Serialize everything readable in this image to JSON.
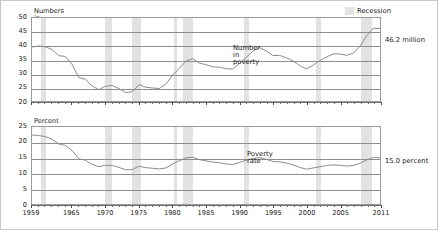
{
  "figure": {
    "legend": {
      "label": "Recession",
      "swatch_color": "#e2e2e2"
    },
    "background": "#ffffff",
    "line_color": "#8a8a8a",
    "grid_color": "#8d8d8d"
  },
  "chart_data": [
    {
      "type": "line",
      "title": "",
      "ylabel": "Numbers in millions",
      "xlabel": "",
      "ylim": [
        20,
        50
      ],
      "yticks": [
        20,
        25,
        30,
        35,
        40,
        45,
        50
      ],
      "xlim": [
        1959,
        2011
      ],
      "xticks": [
        1959,
        1965,
        1970,
        1975,
        1980,
        1985,
        1990,
        1995,
        2000,
        2005,
        2011
      ],
      "grid": true,
      "legend_position": "top-right",
      "series": [
        {
          "name": "Number in poverty",
          "annotation": "46.2 million",
          "x": [
            1959,
            1960,
            1961,
            1962,
            1963,
            1964,
            1965,
            1966,
            1967,
            1968,
            1969,
            1970,
            1971,
            1972,
            1973,
            1974,
            1975,
            1976,
            1977,
            1978,
            1979,
            1980,
            1981,
            1982,
            1983,
            1984,
            1985,
            1986,
            1987,
            1988,
            1989,
            1990,
            1991,
            1992,
            1993,
            1994,
            1995,
            1996,
            1997,
            1998,
            1999,
            2000,
            2001,
            2002,
            2003,
            2004,
            2005,
            2006,
            2007,
            2008,
            2009,
            2010,
            2011
          ],
          "values": [
            39.5,
            39.9,
            39.6,
            38.6,
            36.4,
            36.1,
            33.2,
            28.5,
            27.8,
            25.4,
            24.1,
            25.4,
            25.6,
            24.5,
            23.0,
            23.4,
            25.9,
            25.0,
            24.7,
            24.5,
            26.1,
            29.3,
            31.8,
            34.4,
            35.3,
            33.7,
            33.1,
            32.4,
            32.2,
            31.7,
            31.5,
            33.6,
            35.7,
            38.0,
            39.3,
            38.1,
            36.4,
            36.5,
            35.6,
            34.5,
            32.8,
            31.6,
            32.9,
            34.6,
            35.9,
            37.0,
            37.0,
            36.5,
            37.3,
            39.8,
            43.6,
            46.3,
            46.2
          ]
        }
      ],
      "recession_bands": [
        [
          1960.3,
          1961.1
        ],
        [
          1969.9,
          1970.9
        ],
        [
          1973.9,
          1975.2
        ],
        [
          1980.1,
          1980.5
        ],
        [
          1981.5,
          1982.9
        ],
        [
          1990.5,
          1991.2
        ],
        [
          2001.2,
          2001.9
        ],
        [
          2007.9,
          2009.5
        ]
      ]
    },
    {
      "type": "line",
      "title": "",
      "ylabel": "Percent",
      "xlabel": "",
      "ylim": [
        0,
        25
      ],
      "yticks": [
        0,
        5,
        10,
        15,
        20,
        25
      ],
      "xlim": [
        1959,
        2011
      ],
      "xticks": [
        1959,
        1965,
        1970,
        1975,
        1980,
        1985,
        1990,
        1995,
        2000,
        2005,
        2011
      ],
      "grid": true,
      "legend_position": "none",
      "series": [
        {
          "name": "Poverty rate",
          "annotation": "15.0 percent",
          "x": [
            1959,
            1960,
            1961,
            1962,
            1963,
            1964,
            1965,
            1966,
            1967,
            1968,
            1969,
            1970,
            1971,
            1972,
            1973,
            1974,
            1975,
            1976,
            1977,
            1978,
            1979,
            1980,
            1981,
            1982,
            1983,
            1984,
            1985,
            1986,
            1987,
            1988,
            1989,
            1990,
            1991,
            1992,
            1993,
            1994,
            1995,
            1996,
            1997,
            1998,
            1999,
            2000,
            2001,
            2002,
            2003,
            2004,
            2005,
            2006,
            2007,
            2008,
            2009,
            2010,
            2011
          ],
          "values": [
            22.4,
            22.2,
            21.9,
            21.0,
            19.5,
            19.0,
            17.3,
            14.7,
            14.2,
            12.8,
            12.1,
            12.6,
            12.5,
            11.9,
            11.1,
            11.2,
            12.3,
            11.8,
            11.6,
            11.4,
            11.7,
            13.0,
            14.0,
            15.0,
            15.2,
            14.4,
            14.0,
            13.6,
            13.4,
            13.0,
            12.8,
            13.5,
            14.2,
            14.8,
            15.1,
            14.5,
            13.8,
            13.7,
            13.3,
            12.7,
            11.9,
            11.3,
            11.7,
            12.1,
            12.5,
            12.7,
            12.6,
            12.3,
            12.5,
            13.2,
            14.3,
            15.1,
            15.0
          ]
        }
      ],
      "recession_bands": [
        [
          1960.3,
          1961.1
        ],
        [
          1969.9,
          1970.9
        ],
        [
          1973.9,
          1975.2
        ],
        [
          1980.1,
          1980.5
        ],
        [
          1981.5,
          1982.9
        ],
        [
          1990.5,
          1991.2
        ],
        [
          2001.2,
          2001.9
        ],
        [
          2007.9,
          2009.5
        ]
      ]
    }
  ]
}
